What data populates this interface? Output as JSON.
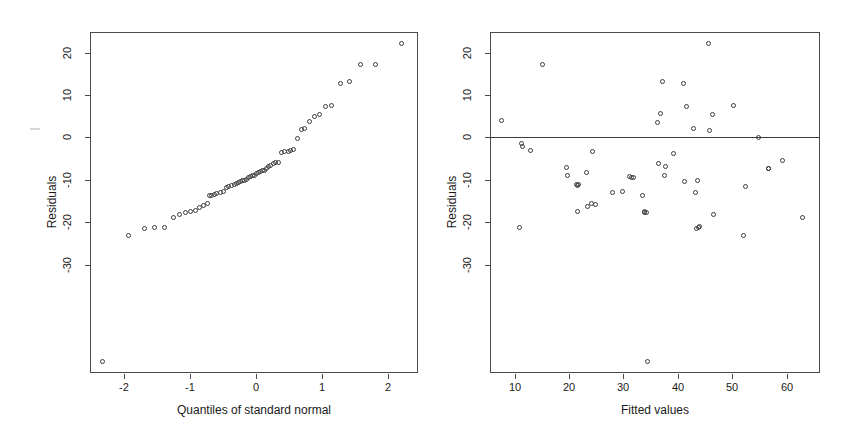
{
  "figure": {
    "background": "#ffffff",
    "axis_color": "#4a4a4a",
    "point_color": "#3b3b3b",
    "width": 864,
    "height": 439
  },
  "chart_data": [
    {
      "type": "scatter",
      "name": "normal-qq-plot",
      "title": "",
      "xlabel": "Quantiles of standard normal",
      "ylabel": "Residuals",
      "xlim": [
        -2.5,
        2.55
      ],
      "ylim": [
        -36.5,
        24.5
      ],
      "xticks": [
        -2,
        -1,
        0,
        1,
        2
      ],
      "xticklabels": [
        "-2",
        "-1",
        "0",
        "1",
        "2"
      ],
      "yticks": [
        20,
        10,
        0,
        -10,
        -20,
        -30
      ],
      "yticklabels": [
        "20",
        "10",
        "0",
        "-10",
        "-20",
        "-30"
      ],
      "grid": false,
      "legend": false,
      "x": [
        -2.3,
        -1.9,
        -1.66,
        -1.5,
        -1.35,
        -1.22,
        -1.12,
        -1.03,
        -0.95,
        -0.88,
        -0.81,
        -0.75,
        -0.69,
        -0.66,
        -0.63,
        -0.59,
        -0.55,
        -0.49,
        -0.45,
        -0.4,
        -0.36,
        -0.32,
        -0.28,
        -0.25,
        -0.21,
        -0.18,
        -0.15,
        -0.12,
        -0.09,
        -0.06,
        -0.03,
        0.0,
        0.03,
        0.06,
        0.09,
        0.12,
        0.15,
        0.18,
        0.21,
        0.25,
        0.28,
        0.32,
        0.36,
        0.4,
        0.45,
        0.49,
        0.55,
        0.59,
        0.63,
        0.69,
        0.75,
        0.81,
        0.88,
        0.95,
        1.03,
        1.12,
        1.22,
        1.35,
        1.5,
        1.66,
        1.9,
        2.3
      ],
      "y": [
        -34.5,
        -11.9,
        -10.6,
        -10.4,
        -10.4,
        -8.6,
        -8.1,
        -7.8,
        -7.6,
        -7.4,
        -6.9,
        -6.6,
        -6.1,
        -4.8,
        -4.7,
        -4.6,
        -4.4,
        -4.2,
        -4.1,
        -3.3,
        -3.1,
        -2.9,
        -2.8,
        -2.6,
        -2.4,
        -2.2,
        -2.1,
        -2.0,
        -1.8,
        -1.5,
        -1.3,
        -1.2,
        -1.1,
        -0.9,
        -0.7,
        -0.5,
        -0.3,
        -0.2,
        0.1,
        0.4,
        0.6,
        0.9,
        1.1,
        1.2,
        2.9,
        3.1,
        3.2,
        3.3,
        3.4,
        5.5,
        7.0,
        7.3,
        8.5,
        9.4,
        9.8,
        11.2,
        11.4,
        15.3,
        15.6,
        18.6,
        18.7,
        22.4
      ]
    },
    {
      "type": "scatter",
      "name": "residuals-vs-fitted-plot",
      "title": "",
      "xlabel": "Fitted values",
      "ylabel": "Residuals",
      "xlim": [
        5.5,
        66.5
      ],
      "ylim": [
        -36.5,
        24.5
      ],
      "xticks": [
        10,
        20,
        30,
        40,
        50,
        60
      ],
      "xticklabels": [
        "10",
        "20",
        "30",
        "40",
        "50",
        "60"
      ],
      "yticks": [
        20,
        10,
        0,
        -10,
        -20,
        -30
      ],
      "yticklabels": [
        "20",
        "10",
        "0",
        "-10",
        "-20",
        "-30"
      ],
      "grid": false,
      "legend": false,
      "reference_line_y": 0,
      "x": [
        7.6,
        10.9,
        11.4,
        11.5,
        12.9,
        15.2,
        19.6,
        19.8,
        21.4,
        21.6,
        21.7,
        21.8,
        23.3,
        23.6,
        24.2,
        24.5,
        25.0,
        28.2,
        29.9,
        31.3,
        31.7,
        32.1,
        33.6,
        34.0,
        34.1,
        34.4,
        34.6,
        36.4,
        36.7,
        37.0,
        37.4,
        37.7,
        37.9,
        39.4,
        41.2,
        41.5,
        41.8,
        43.1,
        43.4,
        43.6,
        43.8,
        44.0,
        44.2,
        45.8,
        46.1,
        46.7,
        46.9,
        50.6,
        52.4,
        52.7,
        55.2,
        56.9,
        57.0,
        59.6,
        63.3
      ],
      "y": [
        8.7,
        -10.5,
        4.5,
        4.0,
        3.3,
        18.6,
        0.3,
        -1.1,
        -2.7,
        -2.9,
        -7.6,
        -2.8,
        -0.7,
        -6.8,
        -6.2,
        3.2,
        -6.4,
        -4.2,
        -4.1,
        -1.3,
        -1.5,
        -1.6,
        -4.7,
        -7.6,
        -7.8,
        -7.7,
        -34.5,
        8.4,
        0.9,
        10.0,
        15.6,
        -1.1,
        0.4,
        2.8,
        15.2,
        -2.2,
        11.2,
        7.3,
        -4.3,
        -10.7,
        -2.1,
        -10.4,
        -10.3,
        22.4,
        6.9,
        9.7,
        -8.2,
        11.4,
        -11.9,
        -3.1,
        5.6,
        0.1,
        0.0,
        1.6,
        -8.6
      ]
    }
  ]
}
